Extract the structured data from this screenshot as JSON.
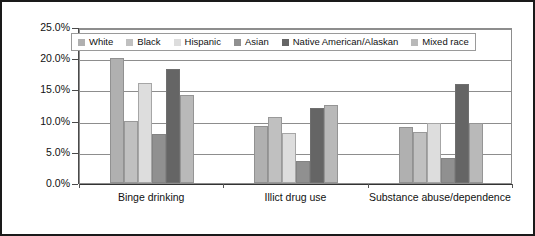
{
  "chart_data": {
    "type": "bar",
    "title": "",
    "subtitle": "",
    "xlabel": "",
    "ylabel": "",
    "ylim": [
      0,
      25
    ],
    "ytick_labels": [
      "25.0%",
      "20.0%",
      "15.0%",
      "10.0%",
      "5.0%",
      "0.0%"
    ],
    "ytick_values": [
      25,
      20,
      15,
      10,
      5,
      0
    ],
    "grid": true,
    "legend_position": "top-left",
    "value_suffix": "%",
    "categories": [
      "Binge drinking",
      "Illict drug use",
      "Substance abuse/dependence"
    ],
    "series": [
      {
        "name": "White",
        "color": "#b0b0b0",
        "values": [
          20.0,
          9.1,
          8.9
        ]
      },
      {
        "name": "Black",
        "color": "#c0c0c0",
        "values": [
          10.0,
          10.6,
          8.1
        ]
      },
      {
        "name": "Hispanic",
        "color": "#dddddd",
        "values": [
          16.0,
          8.0,
          9.6
        ]
      },
      {
        "name": "Asian",
        "color": "#909090",
        "values": [
          7.8,
          3.5,
          4.0
        ]
      },
      {
        "name": "Native American/Alaskan",
        "color": "#656565",
        "values": [
          18.3,
          12.1,
          15.8
        ]
      },
      {
        "name": "Mixed race",
        "color": "#b9b9b9",
        "values": [
          14.1,
          12.5,
          9.6
        ]
      }
    ]
  },
  "figure": {
    "border_color": "#1a1a1a",
    "plot_background": "#ffffff",
    "gridline_color": "#8d8d8d",
    "axis_color": "#333333"
  }
}
